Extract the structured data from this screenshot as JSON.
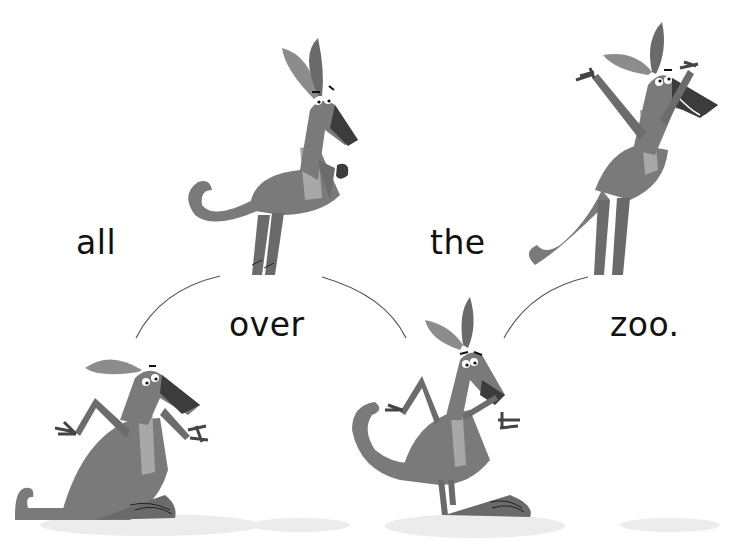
{
  "page": {
    "type": "picture-book-spread",
    "style": "grayscale illustration"
  },
  "text": {
    "words": [
      {
        "id": "w1",
        "label": "all"
      },
      {
        "id": "w2",
        "label": "over"
      },
      {
        "id": "w3",
        "label": "the"
      },
      {
        "id": "w4",
        "label": "zoo."
      }
    ]
  },
  "illustration": {
    "subjects": [
      {
        "id": "kangaroo-1",
        "pose": "sitting, arms spread",
        "position": "bottom-left"
      },
      {
        "id": "kangaroo-2",
        "pose": "mid-jump, paws curled",
        "position": "top-center-left"
      },
      {
        "id": "kangaroo-3",
        "pose": "standing, arms out",
        "position": "bottom-center-right"
      },
      {
        "id": "kangaroo-4",
        "pose": "mid-jump, arms raised, smiling",
        "position": "top-right"
      }
    ],
    "colors": {
      "body": "#7a7a7a",
      "body_dark": "#686868",
      "belly": "#a8a8a8",
      "snout": "#3c3c3c",
      "ear_inner": "#8c8c8c",
      "shadow": "#ececec",
      "line": "#444444",
      "text": "#111111"
    }
  }
}
